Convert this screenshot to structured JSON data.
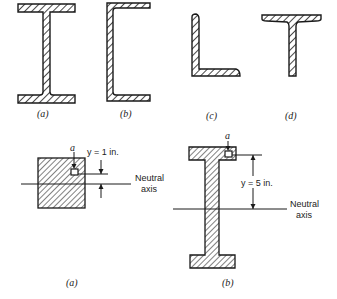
{
  "figure_top": {
    "sections": [
      {
        "id": "a",
        "caption": "(a)",
        "shape": "wide-flange I-beam"
      },
      {
        "id": "b",
        "caption": "(b)",
        "shape": "channel section"
      },
      {
        "id": "c",
        "caption": "(c)",
        "shape": "angle section"
      },
      {
        "id": "d",
        "caption": "(d)",
        "shape": "tee section"
      }
    ]
  },
  "figure_bottom": {
    "panels": [
      {
        "id": "a",
        "caption": "(a)",
        "shape": "solid square section",
        "point_label": "a",
        "dimension_label": "y = 1 in.",
        "axis_label_line1": "Neutral",
        "axis_label_line2": "axis"
      },
      {
        "id": "b",
        "caption": "(b)",
        "shape": "I-beam section",
        "point_label": "a",
        "dimension_label": "y = 5 in.",
        "axis_label_line1": "Neutral",
        "axis_label_line2": "axis"
      }
    ]
  },
  "colors": {
    "stroke": "#1a1a1a",
    "background": "#ffffff"
  }
}
